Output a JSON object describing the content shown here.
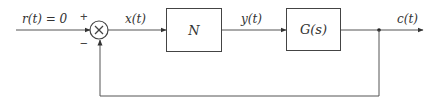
{
  "diagram": {
    "type": "feedback-control-block-diagram",
    "signals": {
      "input": "r(t) = 0",
      "error": "x(t)",
      "intermediate": "y(t)",
      "output": "c(t)"
    },
    "summing_junction": {
      "symbol": "×",
      "plus_sign": "+",
      "minus_sign": "−"
    },
    "blocks": [
      {
        "id": "nonlinear",
        "label": "N"
      },
      {
        "id": "plant",
        "label": "G(s)"
      }
    ],
    "feedback": "unity negative feedback",
    "colors": {
      "line": "#555555",
      "text": "#333333",
      "background": "#ffffff"
    }
  }
}
